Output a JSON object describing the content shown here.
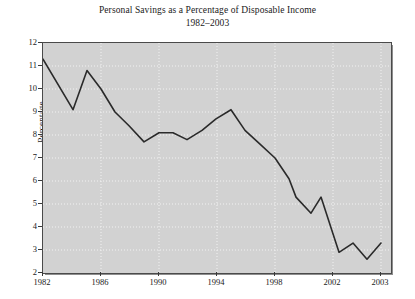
{
  "chart_data": {
    "type": "line",
    "title": "Personal Savings as a Percentage of Disposable Income",
    "subtitle": "1982–2003",
    "xlabel": "",
    "ylabel": "Percentage",
    "ylim": [
      2,
      12
    ],
    "xlim": [
      1982,
      2003
    ],
    "grid": true,
    "legend": null,
    "y_ticks": [
      2,
      3,
      4,
      5,
      6,
      7,
      8,
      9,
      10,
      11,
      12
    ],
    "x_ticks": [
      1982,
      1986,
      1990,
      1994,
      1998,
      2002,
      2003
    ],
    "x_tick_labels": [
      "1982",
      "1986",
      "1990",
      "1994",
      "1998",
      "2002",
      "2003"
    ],
    "x": [
      1982,
      1983,
      1984,
      1985,
      1986,
      1987,
      1988,
      1989,
      1990,
      1991,
      1992,
      1993,
      1994,
      1995,
      1996,
      1997,
      1998,
      1999,
      2000,
      2001,
      2002,
      2002.5,
      2003
    ],
    "values": [
      11.3,
      9.1,
      10.8,
      10.0,
      9.0,
      8.4,
      7.7,
      8.1,
      8.1,
      7.8,
      8.2,
      8.7,
      9.1,
      8.2,
      7.6,
      7.0,
      6.1,
      5.3,
      4.6,
      5.3,
      2.9,
      3.3,
      2.6
    ],
    "series": [
      {
        "name": "Personal savings rate",
        "color": "#2a2a2a",
        "values": [
          11.3,
          9.1,
          10.8,
          10.0,
          9.0,
          8.4,
          7.7,
          8.1,
          8.1,
          7.8,
          8.2,
          8.7,
          9.1,
          8.2,
          7.6,
          7.0,
          6.1,
          5.3,
          4.6,
          5.3,
          2.9,
          3.3,
          2.6
        ]
      }
    ],
    "points_px": [
      [
        42,
        11.3
      ],
      [
        72,
        9.1
      ],
      [
        86,
        10.8
      ],
      [
        100,
        10.0
      ],
      [
        114,
        9.0
      ],
      [
        128,
        8.4
      ],
      [
        143,
        7.7
      ],
      [
        158,
        8.1
      ],
      [
        172,
        8.1
      ],
      [
        186,
        7.8
      ],
      [
        201,
        8.2
      ],
      [
        215,
        8.7
      ],
      [
        230,
        9.1
      ],
      [
        244,
        8.2
      ],
      [
        259,
        7.6
      ],
      [
        274,
        7.0
      ],
      [
        288,
        6.1
      ],
      [
        295,
        5.3
      ],
      [
        310,
        4.6
      ],
      [
        320,
        5.3
      ],
      [
        338,
        2.9
      ],
      [
        352,
        3.3
      ],
      [
        366,
        2.6
      ],
      [
        380,
        3.3
      ]
    ],
    "background_color": "#d2d2d2",
    "gridline_color": "#f2f2f2",
    "line_color": "#2a2a2a"
  }
}
